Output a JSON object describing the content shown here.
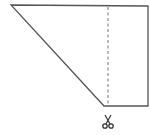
{
  "diagram": {
    "type": "geometry-figure",
    "shape": {
      "name": "trapezoid",
      "points": [
        [
          11,
          5
        ],
        [
          148,
          6
        ],
        [
          148,
          106
        ],
        [
          104,
          106
        ]
      ],
      "stroke": "#555555"
    },
    "cut_line": {
      "style": "dashed",
      "x": 108,
      "y1": 7,
      "y2": 104,
      "stroke": "#777777"
    },
    "scissors": {
      "icon": "scissors-icon",
      "glyph": "✂",
      "x": 108,
      "y": 122
    }
  }
}
